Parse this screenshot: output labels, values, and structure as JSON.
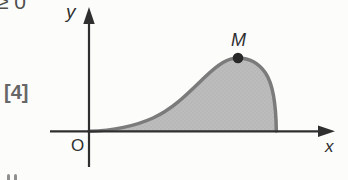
{
  "figure": {
    "clipped_top_text": "≥ 0",
    "marks_label": "[4]",
    "axis_labels": {
      "x": "x",
      "y": "y"
    },
    "origin_label": "O",
    "point_label": "M",
    "colors": {
      "background": "#fcfcfb",
      "axis": "#2f2f2f",
      "text": "#2f2f2f",
      "marks_text": "#676767",
      "curve_stroke": "#7b7b7b",
      "region_fill": "#bcbcbc",
      "region_texture": "#b1b1b1",
      "point_fill": "#282828"
    }
  }
}
